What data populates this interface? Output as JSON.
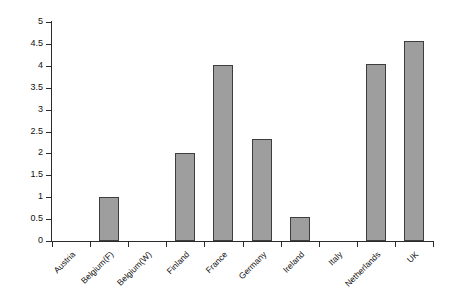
{
  "chart_data": {
    "type": "bar",
    "title": "",
    "subtitle": "",
    "xlabel": "",
    "ylabel": "",
    "categories": [
      "Austria",
      "Belgium(F)",
      "Belgium(W)",
      "Finland",
      "France",
      "Germany",
      "Ireland",
      "Italy",
      "Netherlands",
      "UK"
    ],
    "values": [
      0,
      1.01,
      0,
      2.02,
      4.03,
      2.33,
      0.54,
      0,
      4.05,
      4.57
    ],
    "series": [
      {
        "name": "",
        "values": [
          0,
          1.01,
          0,
          2.02,
          4.03,
          2.33,
          0.54,
          0,
          4.05,
          4.57
        ]
      }
    ],
    "ylim": [
      0,
      5
    ],
    "ytick_values": [
      0,
      0.5,
      1,
      1.5,
      2,
      2.5,
      3,
      3.5,
      4,
      4.5,
      5
    ],
    "ytick_labels": [
      "0",
      "0.5",
      "1",
      "1.5",
      "2",
      "2.5",
      "3",
      "3.5",
      "4",
      "4.5",
      "5"
    ],
    "grid": false,
    "legend": "none",
    "legend_entries": [],
    "annotations": [],
    "bar_fill_color": "#9e9e9e",
    "bar_border_color": "#3d3d3d",
    "axis_color": "#2b2b2b",
    "background_color": "#ffffff",
    "xlabel_rotation_degrees": -45
  }
}
